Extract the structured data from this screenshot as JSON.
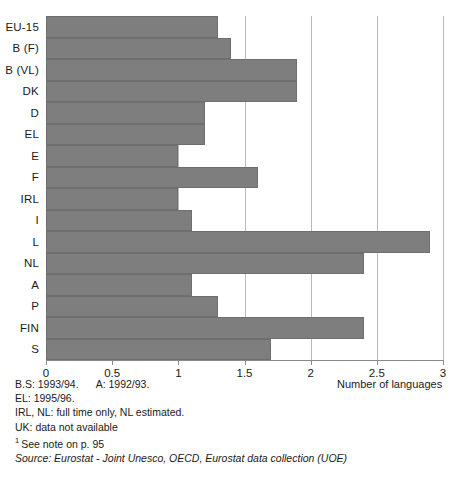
{
  "chart_data": {
    "type": "bar",
    "orientation": "horizontal",
    "title": "",
    "xlabel": "Number of languages",
    "ylabel": "",
    "xlim": [
      0,
      3
    ],
    "xticks": [
      "0",
      "0.5",
      "1",
      "1.5",
      "2",
      "2.5",
      "3"
    ],
    "xtick_values": [
      0,
      0.5,
      1,
      1.5,
      2,
      2.5,
      3
    ],
    "grid": true,
    "legend": null,
    "categories": [
      "EU-15",
      "B (F)",
      "B (VL)",
      "DK",
      "D",
      "EL",
      "E",
      "F",
      "IRL",
      "I",
      "L",
      "NL",
      "A",
      "P",
      "FIN",
      "S"
    ],
    "values": [
      1.3,
      1.4,
      1.9,
      1.9,
      1.2,
      1.2,
      1.0,
      1.6,
      1.0,
      1.1,
      2.9,
      2.4,
      1.1,
      1.3,
      2.4,
      1.7
    ],
    "bar_color": "#7e7e7e",
    "gridline_color": "#b9b9b9",
    "axis_color": "#8a8a8a"
  },
  "axis": {
    "x_title": "Number of languages"
  },
  "footnotes": {
    "line1_a": "B.S: 1993/94.",
    "line1_b": "A: 1992/93.",
    "line2": "EL: 1995/96.",
    "line3": "IRL, NL: full time only, NL estimated.",
    "line4": "UK: data not available",
    "line5_marker": "1",
    "line5": "See note on p. 95",
    "source": "Source:  Eurostat - Joint Unesco, OECD, Eurostat data collection (UOE)"
  }
}
